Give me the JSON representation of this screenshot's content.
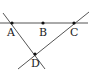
{
  "diagram": {
    "type": "geometry",
    "colors": {
      "line": "#555555",
      "point": "#111111",
      "label": "#222222"
    },
    "points": [
      {
        "name": "A",
        "label": "A",
        "x": 12,
        "y": 23
      },
      {
        "name": "B",
        "label": "B",
        "x": 43,
        "y": 23
      },
      {
        "name": "C",
        "label": "C",
        "x": 74,
        "y": 23
      },
      {
        "name": "D",
        "label": "D",
        "x": 35,
        "y": 54
      }
    ],
    "lines": [
      {
        "name": "line-ABC",
        "x1": 0,
        "y1": 23,
        "x2": 88,
        "y2": 23
      },
      {
        "name": "line-AD",
        "x1": 3,
        "y1": 13,
        "x2": 45,
        "y2": 69
      },
      {
        "name": "line-CD",
        "x1": 89,
        "y1": 12,
        "x2": 18,
        "y2": 69
      }
    ]
  }
}
